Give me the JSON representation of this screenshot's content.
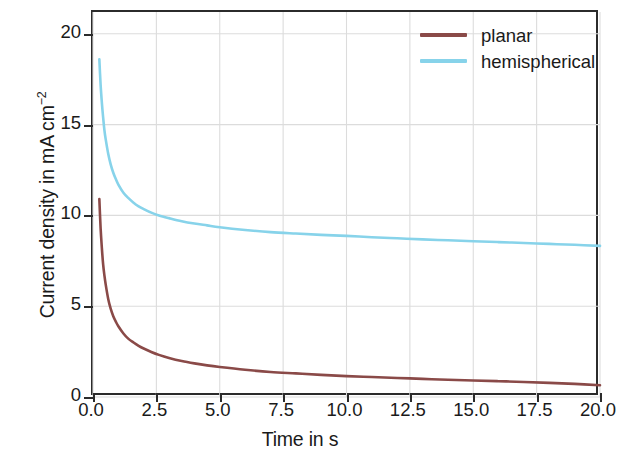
{
  "chart_data": {
    "type": "line",
    "title": "",
    "xlabel": "Time in s",
    "ylabel": "Current density in mA cm",
    "ylabel_exponent": "−2",
    "xlim": [
      0,
      20
    ],
    "ylim": [
      0,
      21.2
    ],
    "xticks": [
      "0.0",
      "2.5",
      "5.0",
      "7.5",
      "10.0",
      "12.5",
      "15.0",
      "17.5",
      "20.0"
    ],
    "xtick_values": [
      0,
      2.5,
      5,
      7.5,
      10,
      12.5,
      15,
      17.5,
      20
    ],
    "yticks": [
      "0",
      "5",
      "10",
      "15",
      "20"
    ],
    "ytick_values": [
      0,
      5,
      10,
      15,
      20
    ],
    "grid": true,
    "grid_color": "#dcdcdc",
    "legend_position": "top-right",
    "series": [
      {
        "name": "planar",
        "color": "#8a4a48",
        "x": [
          0.25,
          0.3,
          0.35,
          0.4,
          0.45,
          0.5,
          0.6,
          0.7,
          0.8,
          0.9,
          1.0,
          1.2,
          1.4,
          1.6,
          1.8,
          2.0,
          2.3,
          2.6,
          3.0,
          3.5,
          4.0,
          4.5,
          5.0,
          6.0,
          7.0,
          8.0,
          9.0,
          10.0,
          11.0,
          12.0,
          13.0,
          14.0,
          15.0,
          16.0,
          17.0,
          18.0,
          19.0,
          20.0
        ],
        "values": [
          10.9,
          9.3,
          8.2,
          7.3,
          6.7,
          6.2,
          5.4,
          4.85,
          4.45,
          4.15,
          3.9,
          3.5,
          3.2,
          3.0,
          2.82,
          2.67,
          2.48,
          2.32,
          2.15,
          1.98,
          1.85,
          1.74,
          1.65,
          1.5,
          1.38,
          1.3,
          1.22,
          1.15,
          1.1,
          1.05,
          1.0,
          0.95,
          0.91,
          0.87,
          0.83,
          0.78,
          0.72,
          0.65
        ]
      },
      {
        "name": "hemispherical",
        "color": "#87d3ea",
        "x": [
          0.25,
          0.3,
          0.35,
          0.4,
          0.45,
          0.5,
          0.6,
          0.7,
          0.8,
          0.9,
          1.0,
          1.2,
          1.4,
          1.6,
          1.8,
          2.0,
          2.3,
          2.6,
          3.0,
          3.5,
          4.0,
          4.5,
          5.0,
          6.0,
          7.0,
          8.0,
          9.0,
          10.0,
          11.0,
          12.0,
          13.0,
          14.0,
          15.0,
          16.0,
          17.0,
          18.0,
          19.0,
          20.0
        ],
        "values": [
          18.6,
          17.2,
          16.2,
          15.4,
          14.7,
          14.2,
          13.4,
          12.8,
          12.35,
          12.0,
          11.7,
          11.25,
          10.95,
          10.7,
          10.5,
          10.35,
          10.15,
          10.0,
          9.85,
          9.68,
          9.55,
          9.45,
          9.35,
          9.2,
          9.08,
          9.0,
          8.93,
          8.87,
          8.8,
          8.74,
          8.68,
          8.63,
          8.58,
          8.53,
          8.48,
          8.43,
          8.38,
          8.32
        ]
      }
    ]
  },
  "legend": {
    "items": [
      {
        "label": "planar",
        "color": "#8a4a48"
      },
      {
        "label": "hemispherical",
        "color": "#87d3ea"
      }
    ]
  },
  "axes": {
    "x_title": "Time in s",
    "y_title_main": "Current density in mA cm",
    "y_title_sup": "−2"
  }
}
